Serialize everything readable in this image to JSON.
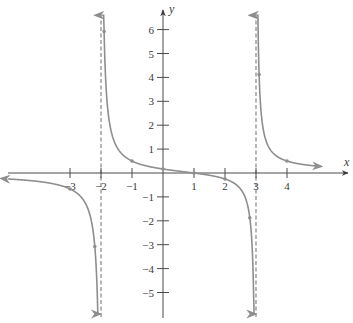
{
  "chart_data": {
    "type": "line",
    "title": "",
    "function": "f(x) = (x - 1) / ((x + 2)(x - 3))",
    "xlabel": "x",
    "ylabel": "y",
    "xlim": [
      -5,
      5.6
    ],
    "ylim": [
      -6,
      6.6
    ],
    "grid": false,
    "legend": null,
    "x_ticks": [
      -3,
      -2,
      -1,
      1,
      2,
      3,
      4
    ],
    "x_tick_labels": [
      "-3",
      "-2",
      "-1",
      "1",
      "2",
      "3",
      "4"
    ],
    "y_ticks": [
      6,
      5,
      4,
      3,
      2,
      1,
      -1,
      -2,
      -3,
      -4,
      -5
    ],
    "y_tick_labels": [
      "6",
      "5",
      "4",
      "3",
      "2",
      "1",
      "−1",
      "−2",
      "−3",
      "−4",
      "−5"
    ],
    "vertical_asymptotes": [
      -2,
      3
    ],
    "horizontal_asymptote": 0,
    "branches": [
      {
        "name": "left branch",
        "x_range": [
          -5,
          -2.035
        ],
        "arrow_start": "left",
        "arrow_end": "down"
      },
      {
        "name": "middle branch",
        "x_range": [
          -1.965,
          2.975
        ],
        "arrow_start": "up",
        "arrow_end": "down"
      },
      {
        "name": "right branch",
        "x_range": [
          3.02,
          5.1
        ],
        "arrow_start": "up",
        "arrow_end": "right"
      }
    ],
    "marked_points": [
      {
        "x": -3,
        "y": -0.667
      },
      {
        "x": -2.2,
        "y": -3.08
      },
      {
        "x": -1.9,
        "y": 5.92
      },
      {
        "x": -1,
        "y": 0.5
      },
      {
        "x": 0,
        "y": 0.167
      },
      {
        "x": 1,
        "y": 0
      },
      {
        "x": 2,
        "y": -0.25
      },
      {
        "x": 2.8,
        "y": -1.875
      },
      {
        "x": 3.1,
        "y": 4.12
      },
      {
        "x": 4,
        "y": 0.5
      }
    ]
  },
  "axes": {
    "x_label": "x",
    "y_label": "y"
  },
  "layout": {
    "origin_px": [
      163,
      173
    ],
    "px_per_unit_x": 31,
    "px_per_unit_y": 23.9,
    "x_axis_px": [
      8,
      348
    ],
    "y_axis_px": [
      10,
      318
    ]
  },
  "colors": {
    "curve": "#8e8e8e",
    "axis": "#4a4a4a",
    "asymptote": "#7a7a7a"
  }
}
